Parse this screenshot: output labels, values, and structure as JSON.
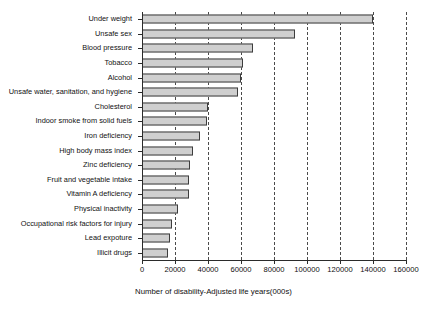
{
  "chart_data": {
    "type": "bar",
    "orientation": "horizontal",
    "title": "",
    "xlabel": "Number of disability-Adjusted life years(000s)",
    "ylabel": "",
    "xlim": [
      0,
      160000
    ],
    "xticks": [
      0,
      20000,
      40000,
      60000,
      80000,
      100000,
      120000,
      140000,
      160000
    ],
    "xticklabels": [
      "0",
      "20000",
      "40000",
      "60000",
      "80000",
      "100000",
      "120000",
      "140000",
      "160000"
    ],
    "grid": "vertical-dashed",
    "legend": "none",
    "categories": [
      "Under weight",
      "Unsafe sex",
      "Blood pressure",
      "Tobacco",
      "Alcohol",
      "Unsafe water, sanitation, and hygiene",
      "Cholesterol",
      "Indoor  smoke  from solid fuels",
      "Iron deficiency",
      "High body mass index",
      "Zinc deficiency",
      "Fruit and vegetable intake",
      "Vitamin A deficiency",
      "Physical inactivity",
      "Occupational risk factors for injury",
      "Lead expoture",
      "Illicit drugs"
    ],
    "values": [
      140000,
      93000,
      67000,
      61000,
      60000,
      58000,
      40000,
      39500,
      35000,
      31000,
      29000,
      28500,
      28500,
      22000,
      18000,
      17000,
      16000
    ],
    "bar_fill_color": "#cfcfcf",
    "bar_edge_color": "#3d3d3d",
    "gridline_color": "#4a4a4a",
    "axis_color": "#2b2b2b",
    "background_color": "#ffffff"
  }
}
